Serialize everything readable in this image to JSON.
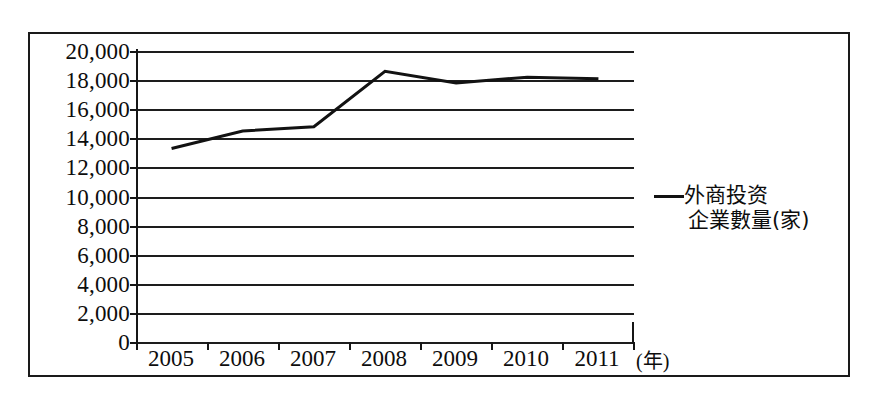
{
  "chart_data": {
    "type": "line",
    "title": "",
    "subtitle": "",
    "xlabel": "年",
    "ylabel": "",
    "x_unit_label": "(年)",
    "categories": [
      "2005",
      "2006",
      "2007",
      "2008",
      "2009",
      "2010",
      "2011"
    ],
    "series": [
      {
        "name": "外商投资企業數量(家)",
        "name_line_1": "外商投资",
        "name_line_2": "企業數量(家)",
        "color": "#121212",
        "values": [
          13300,
          14500,
          14800,
          18600,
          17800,
          18200,
          18100
        ]
      }
    ],
    "ylim": [
      0,
      20000
    ],
    "y_ticks": [
      0,
      2000,
      4000,
      6000,
      8000,
      10000,
      12000,
      14000,
      16000,
      18000,
      20000
    ],
    "y_tick_labels": [
      "0",
      "2,000",
      "4,000",
      "6,000",
      "8,000",
      "10,000",
      "12,000",
      "14,000",
      "16,000",
      "18,000",
      "20,000"
    ],
    "grid": true,
    "grid_orientation": "horizontal",
    "legend_position": "right",
    "frame": true
  },
  "legend": {
    "marker": "line-marker",
    "line_1": "外商投资",
    "line_2": "企業數量(家)"
  },
  "axis": {
    "x_unit": "(年)"
  }
}
